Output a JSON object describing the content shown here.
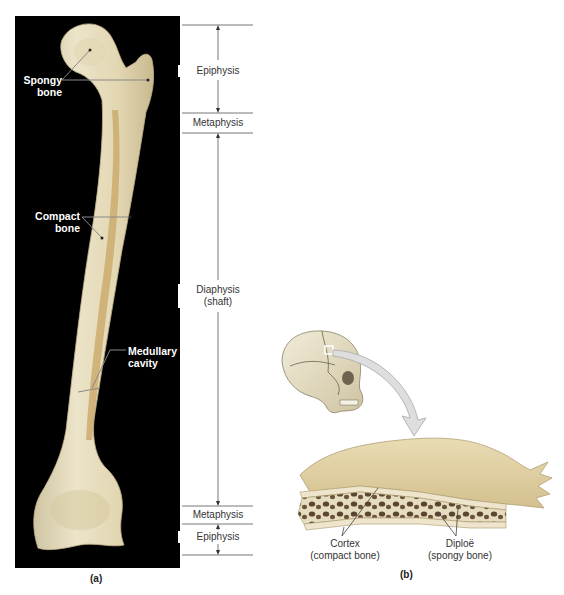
{
  "figure": {
    "panel_a": {
      "letter": "(a)",
      "bone_labels": {
        "spongy_line1": "Spongy",
        "spongy_line2": "bone",
        "compact_line1": "Compact",
        "compact_line2": "bone",
        "medullary_line1": "Medullary",
        "medullary_line2": "cavity"
      },
      "regions": {
        "epiphysis_top": "Epiphysis",
        "metaphysis_top": "Metaphysis",
        "diaphysis_line1": "Diaphysis",
        "diaphysis_line2": "(shaft)",
        "metaphysis_bottom": "Metaphysis",
        "epiphysis_bottom": "Epiphysis"
      }
    },
    "panel_b": {
      "letter": "(b)",
      "labels": {
        "cortex_line1": "Cortex",
        "cortex_line2": "(compact bone)",
        "diploe_line1": "Diploë",
        "diploe_line2": "(spongy bone)"
      }
    },
    "colors": {
      "background": "#ffffff",
      "panel_bg": "#000000",
      "bone": "#e8dfc2",
      "bone_shadow": "#c9b27a",
      "marrow": "#b8935a",
      "skull": "#e6dfc8",
      "arrow": "#dcdcdc",
      "scale_lines": "#666666"
    }
  }
}
